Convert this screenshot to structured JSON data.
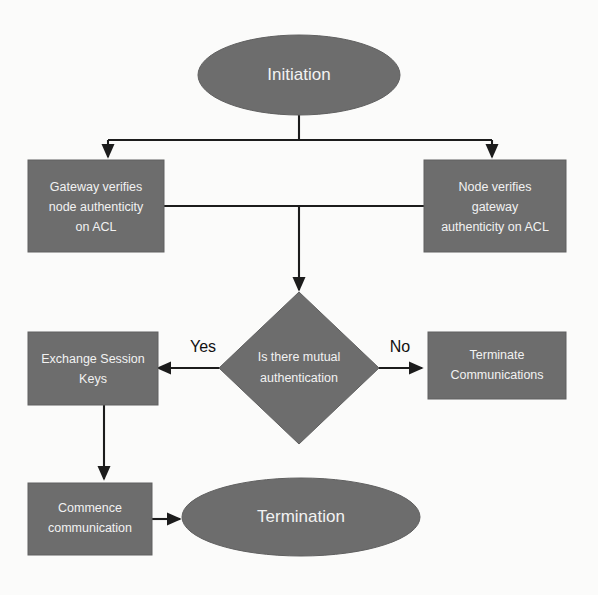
{
  "diagram": {
    "background_color": "#fbfbfa",
    "node_fill_color": "#6d6d6d",
    "node_text_color": "#f2f2f2",
    "edge_color": "#1c1c1c",
    "nodes": [
      {
        "id": "initiation",
        "shape": "ellipse",
        "label": "Initiation",
        "lines": [
          "Initiation"
        ]
      },
      {
        "id": "gateway-verifies",
        "shape": "rectangle",
        "label": "Gateway verifies node authenticity on ACL",
        "lines": [
          "Gateway verifies",
          "node authenticity",
          "on ACL"
        ]
      },
      {
        "id": "node-verifies",
        "shape": "rectangle",
        "label": "Node verifies gateway authenticity on ACL",
        "lines": [
          "Node verifies",
          "gateway",
          "authenticity on ACL"
        ]
      },
      {
        "id": "mutual-auth-decision",
        "shape": "diamond",
        "label": "Is there mutual authentication",
        "lines": [
          "Is there mutual",
          "authentication"
        ]
      },
      {
        "id": "exchange-session-keys",
        "shape": "rectangle",
        "label": "Exchange Session Keys",
        "lines": [
          "Exchange Session",
          "Keys"
        ]
      },
      {
        "id": "terminate-communications",
        "shape": "rectangle",
        "label": "Terminate Communications",
        "lines": [
          "Terminate",
          "Communications"
        ]
      },
      {
        "id": "commence-communication",
        "shape": "rectangle",
        "label": "Commence communication",
        "lines": [
          "Commence",
          "communication"
        ]
      },
      {
        "id": "termination",
        "shape": "ellipse",
        "label": "Termination",
        "lines": [
          "Termination"
        ]
      }
    ],
    "edges": [
      {
        "id": "initiation-to-gateway",
        "from": "initiation",
        "to": "gateway-verifies",
        "label": ""
      },
      {
        "id": "initiation-to-node",
        "from": "initiation",
        "to": "node-verifies",
        "label": ""
      },
      {
        "id": "verify-join-to-decision",
        "from": "gateway-verifies",
        "to": "mutual-auth-decision",
        "label": ""
      },
      {
        "id": "decision-to-exchange",
        "from": "mutual-auth-decision",
        "to": "exchange-session-keys",
        "label": "Yes"
      },
      {
        "id": "decision-to-terminate",
        "from": "mutual-auth-decision",
        "to": "terminate-communications",
        "label": "No"
      },
      {
        "id": "exchange-to-commence",
        "from": "exchange-session-keys",
        "to": "commence-communication",
        "label": ""
      },
      {
        "id": "commence-to-termination",
        "from": "commence-communication",
        "to": "termination",
        "label": ""
      }
    ]
  }
}
